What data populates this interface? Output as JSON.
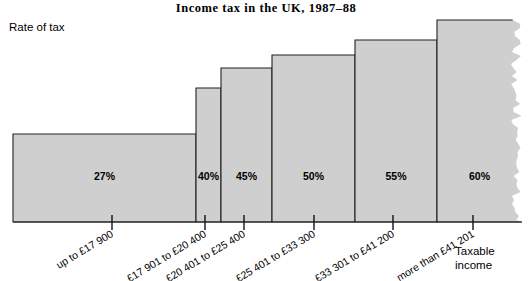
{
  "chart_data": {
    "type": "bar",
    "title": "Income tax in the UK, 1987–88",
    "subtitle": "",
    "xlabel": "Taxable income",
    "ylabel": "Rate of tax",
    "grid": false,
    "legend": "none",
    "ylim": [
      0,
      65
    ],
    "value_suffix": "%",
    "note": "Stepped marginal income-tax bands; bar widths are proportional to the width of each taxable-income band, the last band is open-ended and drawn with a torn right edge.",
    "categories": [
      "up to £17 900",
      "£17 901 to £20 400",
      "£20 401 to £25 400",
      "£25 401 to £33 300",
      "£33 301 to £41 200",
      "more than £41 201"
    ],
    "values": [
      27,
      40,
      45,
      50,
      55,
      60
    ],
    "value_labels": [
      "27%",
      "40%",
      "45%",
      "50%",
      "55%",
      "60%"
    ],
    "tick_labels": [
      "up to £17 900",
      "£17 901 to £20 400",
      "£20 401 to £25 400",
      "£25 401 to £33 300",
      "£33 301 to £41 200",
      "more than £41 201"
    ],
    "bars": [
      {
        "label": "up to £17 900",
        "value": 27,
        "value_label": "27%",
        "x0": 13,
        "x1": 196,
        "top": 134,
        "tick_x": 112
      },
      {
        "label": "£17 901 to £20 400",
        "value": 40,
        "value_label": "40%",
        "x0": 196,
        "x1": 221,
        "top": 88,
        "tick_x": 205
      },
      {
        "label": "£20 401 to £25 400",
        "value": 45,
        "value_label": "45%",
        "x0": 221,
        "x1": 272,
        "top": 68,
        "tick_x": 244
      },
      {
        "label": "£25 401 to £33 300",
        "value": 50,
        "value_label": "50%",
        "x0": 272,
        "x1": 355,
        "top": 55,
        "tick_x": 314
      },
      {
        "label": "£33 301 to £41 200",
        "value": 55,
        "value_label": "55%",
        "x0": 355,
        "x1": 437,
        "top": 40,
        "tick_x": 393
      },
      {
        "label": "more than £41 201",
        "value": 60,
        "value_label": "60%",
        "x0": 437,
        "x1": 522,
        "top": 20,
        "tick_x": 473
      }
    ],
    "baseline_y": 222,
    "fill_color": "#cfcfcf",
    "line_color": "#222222",
    "background_color": "#ffffff",
    "tick_label_rotation_deg": -31,
    "xaxis_label_lines": [
      "Taxable",
      "income"
    ]
  },
  "axis": {
    "y_title": "Rate of tax",
    "x_title_line1": "Taxable",
    "x_title_line2": "income"
  },
  "header": {
    "title": "Income tax in the UK, 1987–88"
  }
}
